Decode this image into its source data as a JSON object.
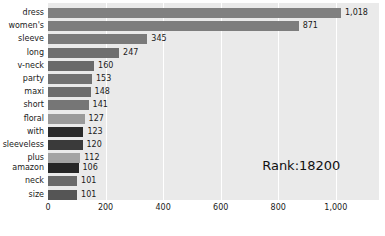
{
  "chart_data": {
    "type": "bar",
    "orientation": "horizontal",
    "title": "",
    "xlabel": "",
    "ylabel": "",
    "xlim": [
      0,
      1150
    ],
    "xticks": [
      0,
      200,
      400,
      600,
      800,
      1000
    ],
    "xtick_labels": [
      "0",
      "200",
      "400",
      "600",
      "800",
      "1,000"
    ],
    "grid": true,
    "grid_axis": "x",
    "legend": false,
    "categories": [
      "dress",
      "women's",
      "sleeve",
      "long",
      "v-neck",
      "party",
      "maxi",
      "short",
      "floral",
      "with",
      "sleeveless",
      "plus",
      "amazon",
      "neck",
      "size"
    ],
    "values": [
      1018,
      871,
      345,
      247,
      160,
      153,
      148,
      141,
      127,
      123,
      120,
      112,
      106,
      101,
      101
    ],
    "value_labels": [
      "1,018",
      "871",
      "345",
      "247",
      "160",
      "153",
      "148",
      "141",
      "127",
      "123",
      "120",
      "112",
      "106",
      "101",
      "101"
    ],
    "bar_colors": [
      "#808080",
      "#7d7d7d",
      "#7a7a7a",
      "#6f6f6f",
      "#6a6a6a",
      "#727272",
      "#6d6d6d",
      "#767676",
      "#9a9a9a",
      "#2b2b2b",
      "#3a3a3a",
      "#a3a3a3",
      "#262626",
      "#6a6a6a",
      "#555555"
    ],
    "annotations": [
      {
        "text": "Rank:18200",
        "x": 880,
        "y_index": 12
      }
    ]
  },
  "plot": {
    "background_color": "#eaeaea",
    "gridline_color": "#ffffff",
    "figure_background": "#ffffff"
  },
  "annotation": {
    "rank_text": "Rank:18200"
  }
}
